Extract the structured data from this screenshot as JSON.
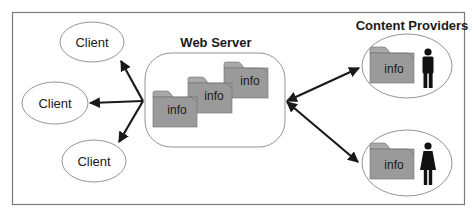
{
  "diagram": {
    "title_server": "Web Server",
    "title_providers": "Content Providers",
    "clients": [
      {
        "label": "Client"
      },
      {
        "label": "Client"
      },
      {
        "label": "Client"
      }
    ],
    "server_folders": [
      {
        "label": "info"
      },
      {
        "label": "info"
      },
      {
        "label": "info"
      }
    ],
    "providers": [
      {
        "folder_label": "info",
        "person": "man-icon"
      },
      {
        "folder_label": "info",
        "person": "woman-icon"
      }
    ],
    "colors": {
      "frame": "#7a7a7a",
      "folder_fill": "#9a9a9a",
      "folder_tab": "#a8a8a8",
      "folder_stroke": "#6e6e6e",
      "arrow": "#1a1a1a",
      "text": "#1a1a1a"
    }
  }
}
